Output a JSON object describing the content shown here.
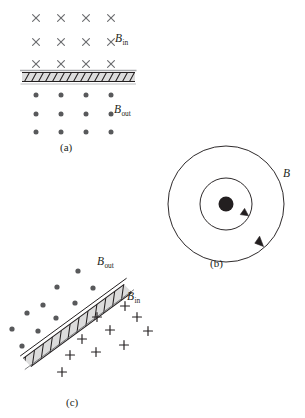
{
  "figure": {
    "background_color": "#ffffff",
    "ink_color": "#231f20",
    "marker_color": "#58595b",
    "bar_fill_color": "#d9d9d9",
    "bar_edge_color": "#231f20",
    "panels": [
      {
        "id": "a",
        "caption": "(a)",
        "description": "horizontal hatched conductor with crosses above and dots below",
        "labels": [
          {
            "name": "b-in-label",
            "symbol": "B",
            "subscript": "in"
          },
          {
            "name": "b-out-label",
            "symbol": "B",
            "subscript": "out"
          }
        ],
        "bar": {
          "x1": 22,
          "y1": 77,
          "x2": 135,
          "y2": 77,
          "thickness": 9
        },
        "cross_marks": {
          "symbol": "x",
          "rows": 3,
          "cols": 4,
          "points": [
            [
              36,
              18
            ],
            [
              61,
              18
            ],
            [
              86,
              18
            ],
            [
              111,
              18
            ],
            [
              36,
              42
            ],
            [
              61,
              42
            ],
            [
              86,
              42
            ],
            [
              111,
              42
            ],
            [
              36,
              64
            ],
            [
              61,
              64
            ],
            [
              86,
              64
            ],
            [
              111,
              64
            ]
          ]
        },
        "dot_marks": {
          "symbol": "dot",
          "rows": 3,
          "cols": 4,
          "points": [
            [
              36,
              95
            ],
            [
              61,
              95
            ],
            [
              86,
              95
            ],
            [
              111,
              95
            ],
            [
              36,
              114
            ],
            [
              61,
              114
            ],
            [
              86,
              114
            ],
            [
              111,
              114
            ],
            [
              36,
              132
            ],
            [
              61,
              132
            ],
            [
              86,
              132
            ],
            [
              111,
              132
            ]
          ]
        }
      },
      {
        "id": "b",
        "caption": "(b)",
        "description": "two concentric circular field lines counterclockwise around a current out of page",
        "labels": [
          {
            "name": "b-label",
            "symbol": "B",
            "subscript": ""
          }
        ],
        "center": [
          226,
          204
        ],
        "center_dot_radius": 7.5,
        "circles": [
          {
            "radius": 26,
            "direction": "counterclockwise",
            "arrow_angle_deg": 35
          },
          {
            "radius": 58,
            "direction": "counterclockwise",
            "arrow_angle_deg": 52
          }
        ]
      },
      {
        "id": "c",
        "caption": "(c)",
        "description": "inclined hatched conductor with dots above left and plus signs below right",
        "labels": [
          {
            "name": "b-out-label",
            "symbol": "B",
            "subscript": "out"
          },
          {
            "name": "b-in-label",
            "symbol": "B",
            "subscript": "in"
          }
        ],
        "bar": {
          "x1": 27,
          "y1": 355,
          "x2": 128,
          "y2": 281,
          "thickness": 10
        },
        "dot_marks": {
          "symbol": "dot",
          "points": [
            [
              78,
              271
            ],
            [
              57,
              287
            ],
            [
              93,
              288
            ],
            [
              43,
              305
            ],
            [
              75,
              303
            ],
            [
              27,
              313
            ],
            [
              56,
              318
            ],
            [
              12,
              329
            ],
            [
              38,
              331
            ],
            [
              22,
              346
            ]
          ]
        },
        "plus_marks": {
          "symbol": "+",
          "points": [
            [
              125,
              306
            ],
            [
              97,
              317
            ],
            [
              137,
              317
            ],
            [
              110,
              330
            ],
            [
              82,
              339
            ],
            [
              148,
              331
            ],
            [
              70,
              355
            ],
            [
              96,
              352
            ],
            [
              124,
              345
            ],
            [
              62,
              372
            ]
          ]
        }
      }
    ]
  }
}
